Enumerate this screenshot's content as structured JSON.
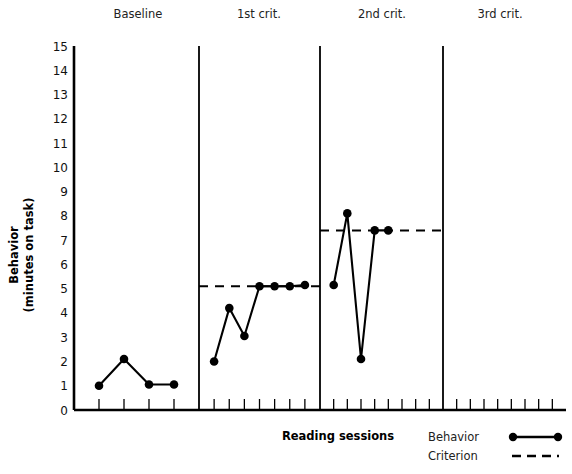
{
  "chart_data": {
    "type": "line",
    "title": "",
    "xlabel": "Reading sessions",
    "ylabel": "Behavior (minutes on task)",
    "ylabel_line1": "Behavior",
    "ylabel_line2": "(minutes on task)",
    "ylim": [
      0,
      15
    ],
    "ytick_labels": [
      "0",
      "1",
      "2",
      "3",
      "4",
      "5",
      "6",
      "7",
      "8",
      "9",
      "10",
      "11",
      "12",
      "13",
      "14",
      "15"
    ],
    "grid": false,
    "legend_position": "bottom-right",
    "phases": [
      {
        "name": "Baseline",
        "label": "Baseline",
        "sessions": 4,
        "criterion": null,
        "values": [
          1.0,
          2.1,
          1.05,
          1.05
        ]
      },
      {
        "name": "1st crit.",
        "label": "1st crit.",
        "sessions": 7,
        "criterion": 5.1,
        "values": [
          2.0,
          4.2,
          3.05,
          5.1,
          5.1,
          5.1,
          5.15
        ]
      },
      {
        "name": "2nd crit.",
        "label": "2nd crit.",
        "sessions": 8,
        "criterion": 7.4,
        "values": [
          5.15,
          8.1,
          2.1,
          7.4,
          7.4
        ]
      },
      {
        "name": "3rd crit.",
        "label": "3rd crit.",
        "sessions": 8,
        "criterion": null,
        "values": []
      }
    ],
    "series": [
      {
        "name": "Behavior",
        "style": "solid-line-with-markers",
        "values": [
          1.0,
          2.1,
          1.05,
          1.05,
          2.0,
          4.2,
          3.05,
          5.1,
          5.1,
          5.1,
          5.15,
          5.15,
          8.1,
          2.1,
          7.4,
          7.4
        ]
      },
      {
        "name": "Criterion",
        "style": "dashed-line",
        "values": [
          null,
          null,
          null,
          null,
          5.1,
          5.1,
          5.1,
          5.1,
          5.1,
          5.1,
          5.1,
          7.4,
          7.4,
          7.4,
          7.4,
          7.4
        ]
      }
    ],
    "legend": [
      {
        "label": "Behavior",
        "marker": "line-with-dots"
      },
      {
        "label": "Criterion",
        "marker": "dashed-line"
      }
    ]
  },
  "colors": {
    "ink": "#000000",
    "background": "#ffffff"
  }
}
